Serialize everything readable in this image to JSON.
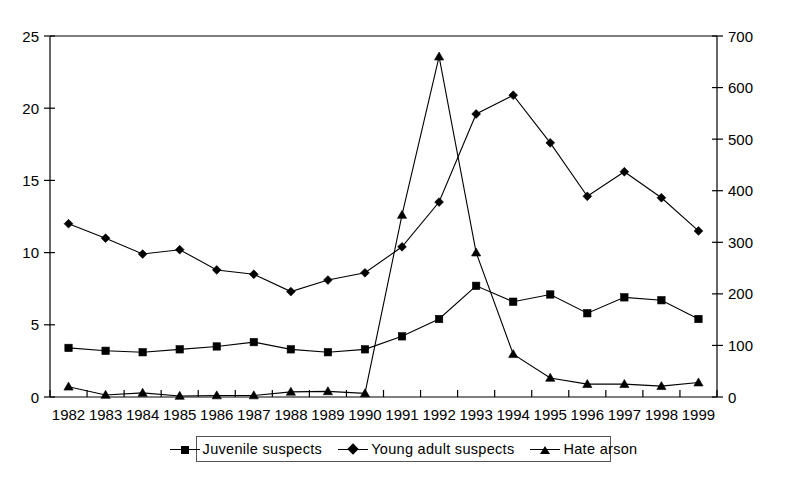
{
  "chart_data": {
    "type": "line",
    "title": "",
    "subtitle": "",
    "xlabel": "",
    "ylabel": "",
    "y2label": "",
    "grid": false,
    "legend_position": "bottom-center",
    "categories": [
      "1982",
      "1983",
      "1984",
      "1985",
      "1986",
      "1987",
      "1988",
      "1989",
      "1990",
      "1991",
      "1992",
      "1993",
      "1994",
      "1995",
      "1996",
      "1997",
      "1998",
      "1999"
    ],
    "x": [
      1982,
      1983,
      1984,
      1985,
      1986,
      1987,
      1988,
      1989,
      1990,
      1991,
      1992,
      1993,
      1994,
      1995,
      1996,
      1997,
      1998,
      1999
    ],
    "ylim": [
      0,
      25
    ],
    "yticks": [
      0,
      5,
      10,
      15,
      20,
      25
    ],
    "ytick_labels": [
      "0",
      "5",
      "10",
      "15",
      "20",
      "25"
    ],
    "y2lim": [
      0,
      700
    ],
    "y2ticks": [
      0,
      100,
      200,
      300,
      400,
      500,
      600,
      700
    ],
    "y2tick_labels": [
      "0",
      "100",
      "200",
      "300",
      "400",
      "500",
      "600",
      "700"
    ],
    "series": [
      {
        "name": "Juvenile suspects",
        "axis": "left",
        "marker": "square",
        "values": [
          3.4,
          3.2,
          3.1,
          3.3,
          3.5,
          3.8,
          3.3,
          3.1,
          3.3,
          4.2,
          5.4,
          7.7,
          6.6,
          7.1,
          5.8,
          6.9,
          6.7,
          5.4
        ]
      },
      {
        "name": "Young adult suspects",
        "axis": "left",
        "marker": "diamond",
        "values": [
          12.0,
          11.0,
          9.9,
          10.2,
          8.8,
          8.5,
          7.3,
          8.1,
          8.6,
          10.4,
          13.5,
          19.6,
          20.9,
          17.6,
          13.9,
          15.6,
          13.8,
          11.5
        ]
      },
      {
        "name": "Hate arson",
        "axis": "right",
        "marker": "triangle",
        "values": [
          20,
          4,
          8,
          2,
          3,
          3,
          10,
          11,
          7,
          353,
          660,
          280,
          83,
          37,
          25,
          25,
          21,
          28
        ]
      }
    ]
  },
  "legend": {
    "items": [
      {
        "label": "Juvenile suspects",
        "marker": "square"
      },
      {
        "label": "Young adult suspects",
        "marker": "diamond"
      },
      {
        "label": "Hate arson",
        "marker": "triangle"
      }
    ]
  }
}
